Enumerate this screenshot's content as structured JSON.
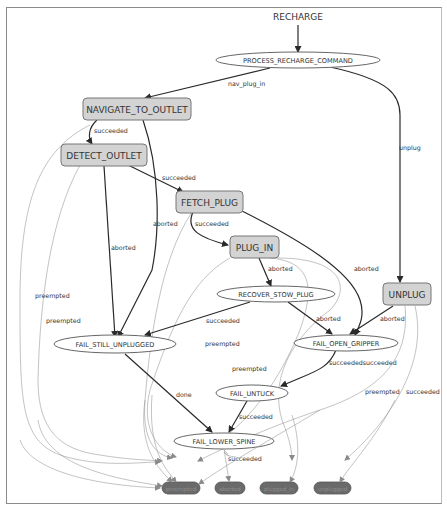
{
  "diagram": {
    "root_label": "RECHARGE",
    "states": {
      "process": "PROCESS_RECHARGE_COMMAND",
      "navigate": "NAVIGATE_TO_OUTLET",
      "detect": "DETECT_OUTLET",
      "fetch": "FETCH_PLUG",
      "plug_in": "PLUG_IN",
      "unplug": "UNPLUG",
      "recover": "RECOVER_STOW_PLUG",
      "fail_still": "FAIL_STILL_UNPLUGGED",
      "fail_open": "FAIL_OPEN_GRIPPER",
      "fail_untuck": "FAIL_UNTUCK",
      "fail_lower": "FAIL_LOWER_SPINE"
    },
    "outcomes": {
      "preempted": "preempted",
      "aborted": "aborted",
      "plugged_in": "plugged_in",
      "unplugged": "unplugged"
    },
    "edge_labels": {
      "nav_plug_in": "nav_plug_in",
      "unplug": "unplug",
      "nav_succeeded": "succeeded",
      "nav_aborted": "aborted",
      "nav_preempted": "preempted",
      "detect_succeeded": "succeeded",
      "detect_aborted": "aborted",
      "detect_preempted": "preempted",
      "fetch_succeeded": "succeeded",
      "fetch_aborted": "aborted",
      "fetch_preempted": "preempted",
      "plugin_aborted": "aborted",
      "plugin_preempted": "preempted",
      "recover_succeeded": "succeeded",
      "recover_aborted": "aborted",
      "unplug_aborted": "aborted",
      "unplug_preempted": "preempted",
      "unplug_succeeded": "succeeded",
      "fail_open_succeeded": "succeededsucceeded",
      "fail_still_done": "done",
      "fail_untuck_succeeded": "succeeded",
      "fail_lower_succeeded": "succeeded"
    }
  }
}
